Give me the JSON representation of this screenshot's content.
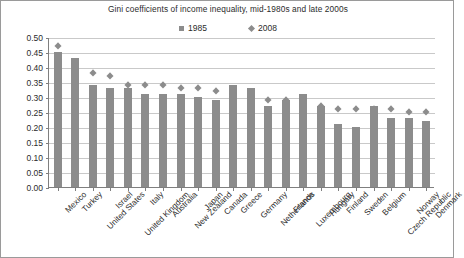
{
  "chart_data": {
    "type": "bar",
    "title": "Gini coefficients of income inequality, mid-1980s and late 2000s",
    "xlabel": "",
    "ylabel": "",
    "ylim": [
      0.0,
      0.5
    ],
    "ytick_step": 0.05,
    "yticks": [
      "0.00",
      "0.05",
      "0.10",
      "0.15",
      "0.20",
      "0.25",
      "0.30",
      "0.35",
      "0.40",
      "0.45",
      "0.50"
    ],
    "grid": true,
    "legend_position": "top-center",
    "categories": [
      "Mexico",
      "Turkey",
      "United States",
      "Israel",
      "United Kingdom",
      "Italy",
      "Australia",
      "New Zealand",
      "Japan",
      "Canada",
      "Greece",
      "Germany",
      "Netherlands",
      "France",
      "Luxembourg",
      "Hungary",
      "Finland",
      "Sweden",
      "Belgium",
      "Czech Republic",
      "Norway",
      "Denmark"
    ],
    "series": [
      {
        "name": "1985",
        "marker": "square",
        "color": "#8c8c8c",
        "values": [
          0.45,
          0.43,
          0.34,
          0.33,
          0.33,
          0.31,
          0.31,
          0.31,
          0.3,
          0.29,
          0.34,
          0.33,
          0.27,
          0.29,
          0.31,
          0.27,
          0.21,
          0.2,
          0.27,
          0.23,
          0.23,
          0.22
        ]
      },
      {
        "name": "2008",
        "marker": "diamond",
        "color": "#8c8c8c",
        "values": [
          0.47,
          0.41,
          0.38,
          0.37,
          0.34,
          0.34,
          0.34,
          0.33,
          0.33,
          0.32,
          0.31,
          0.3,
          0.29,
          0.29,
          0.29,
          0.27,
          0.26,
          0.26,
          0.26,
          0.26,
          0.25,
          0.25
        ]
      }
    ]
  },
  "legend": {
    "entries": [
      {
        "label": "1985",
        "marker_name": "legend-square-marker"
      },
      {
        "label": "2008",
        "marker_name": "legend-diamond-marker"
      }
    ]
  }
}
